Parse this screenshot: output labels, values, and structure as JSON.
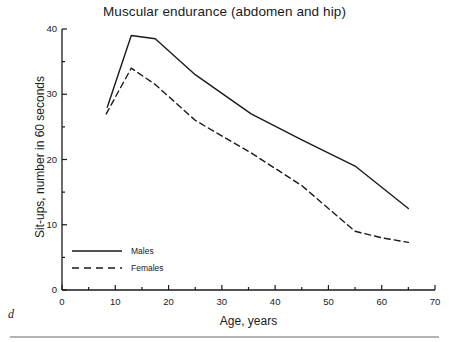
{
  "figure": {
    "panel_letter": "d",
    "background_color": "#ffffff",
    "line_color": "#1a1a1a",
    "rule_color": "#b4b4b4"
  },
  "chart_data": {
    "type": "line",
    "title": "Muscular endurance (abdomen and hip)",
    "xlabel": "Age, years",
    "ylabel": "Sit-ups, number in 60 seconds",
    "xlim": [
      0,
      70
    ],
    "ylim": [
      0,
      40
    ],
    "xticks": [
      0,
      10,
      20,
      30,
      40,
      50,
      60,
      70
    ],
    "xtick_labels": [
      "0",
      "10",
      "20",
      "30",
      "40",
      "50",
      "60",
      "70"
    ],
    "xminor_ticks": [
      5,
      15,
      25,
      35,
      45,
      55,
      65
    ],
    "yticks": [
      0,
      10,
      20,
      30,
      40
    ],
    "ytick_labels": [
      "0",
      "10",
      "20",
      "30",
      "40"
    ],
    "yminor_ticks": [
      5,
      15,
      25,
      35
    ],
    "grid": false,
    "legend_position": "lower left",
    "series": [
      {
        "name": "Males",
        "style": "solid",
        "x": [
          8.5,
          13.0,
          17.5,
          25.0,
          35.5,
          45.0,
          55.0,
          65.0
        ],
        "y": [
          28.0,
          39.0,
          38.5,
          33.0,
          27.0,
          23.0,
          19.0,
          12.5
        ]
      },
      {
        "name": "Females",
        "style": "dashed",
        "x": [
          8.3,
          13.0,
          17.5,
          25.0,
          35.5,
          45.0,
          55.0,
          60.0,
          65.0
        ],
        "y": [
          27.0,
          34.0,
          31.5,
          26.0,
          21.0,
          16.0,
          9.0,
          8.0,
          7.3
        ]
      }
    ],
    "legend": [
      {
        "label": "Males",
        "style": "solid"
      },
      {
        "label": "Females",
        "style": "dashed"
      }
    ]
  }
}
